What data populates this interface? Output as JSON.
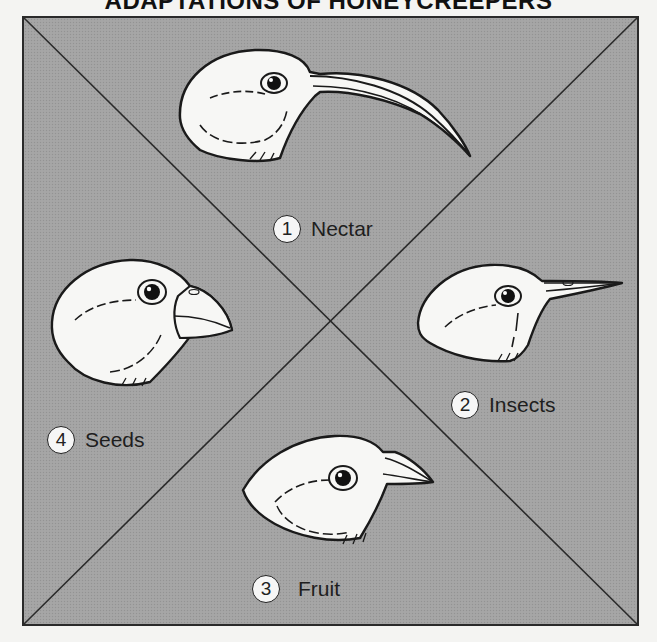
{
  "title": "ADAPTATIONS OF HONEYCREEPERS",
  "colors": {
    "page_background": "#f4f4f2",
    "panel_background": "#a4a4a4",
    "line": "#2a2a2a",
    "bird_fill": "#f7f7f5",
    "outline": "#1a1a1a"
  },
  "quadrants": [
    {
      "number": "1",
      "label": "Nectar",
      "position": "top",
      "beak": "long-curved-beak-icon"
    },
    {
      "number": "2",
      "label": "Insects",
      "position": "right",
      "beak": "thin-pointed-beak-icon"
    },
    {
      "number": "3",
      "label": "Fruit",
      "position": "bottom",
      "beak": "short-medium-beak-icon"
    },
    {
      "number": "4",
      "label": "Seeds",
      "position": "left",
      "beak": "thick-hooked-beak-icon"
    }
  ]
}
